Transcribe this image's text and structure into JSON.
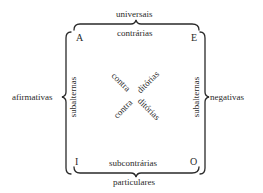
{
  "diagram": {
    "type": "square-of-opposition",
    "corners": {
      "top_left": "A",
      "top_right": "E",
      "bottom_left": "I",
      "bottom_right": "O"
    },
    "edges": {
      "top_outer": "universais",
      "top_inner": "contrárias",
      "bottom_inner": "subcontrárias",
      "bottom_outer": "particulares",
      "left_outer": "afirmativas",
      "left_inner": "subalternas",
      "right_inner": "subalternas",
      "right_outer": "negativas"
    },
    "diagonals": {
      "upper_left": "contra",
      "upper_right": "ditórias",
      "lower_left": "contra",
      "lower_right": "ditórias"
    },
    "colors": {
      "ink": "#2a2a2a",
      "background": "#ffffff"
    }
  }
}
